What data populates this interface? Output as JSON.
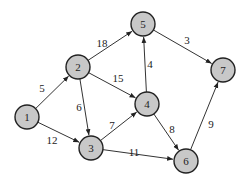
{
  "graph": {
    "directed": true,
    "nodes": [
      {
        "id": "1",
        "label": "1",
        "x": 27,
        "y": 117
      },
      {
        "id": "2",
        "label": "2",
        "x": 78,
        "y": 67
      },
      {
        "id": "3",
        "label": "3",
        "x": 91,
        "y": 148
      },
      {
        "id": "4",
        "label": "4",
        "x": 147,
        "y": 104
      },
      {
        "id": "5",
        "label": "5",
        "x": 143,
        "y": 24
      },
      {
        "id": "6",
        "label": "6",
        "x": 186,
        "y": 161
      },
      {
        "id": "7",
        "label": "7",
        "x": 223,
        "y": 70
      }
    ],
    "edges": [
      {
        "from": "1",
        "to": "2",
        "weight": "5",
        "lx": 42,
        "ly": 88
      },
      {
        "from": "1",
        "to": "3",
        "weight": "12",
        "lx": 52,
        "ly": 140
      },
      {
        "from": "2",
        "to": "5",
        "weight": "18",
        "lx": 102,
        "ly": 43
      },
      {
        "from": "2",
        "to": "4",
        "weight": "15",
        "lx": 118,
        "ly": 78
      },
      {
        "from": "2",
        "to": "3",
        "weight": "6",
        "lx": 79,
        "ly": 107
      },
      {
        "from": "3",
        "to": "4",
        "weight": "7",
        "lx": 112,
        "ly": 125
      },
      {
        "from": "3",
        "to": "6",
        "weight": "11",
        "lx": 134,
        "ly": 152
      },
      {
        "from": "4",
        "to": "5",
        "weight": "4",
        "lx": 150,
        "ly": 64
      },
      {
        "from": "4",
        "to": "6",
        "weight": "8",
        "lx": 172,
        "ly": 129
      },
      {
        "from": "5",
        "to": "7",
        "weight": "3",
        "lx": 187,
        "ly": 40
      },
      {
        "from": "6",
        "to": "7",
        "weight": "9",
        "lx": 211,
        "ly": 124
      }
    ]
  },
  "style": {
    "node_fill": "#c8c8c8",
    "node_stroke": "#222222",
    "edge_color": "#333333",
    "node_radius": 12
  }
}
